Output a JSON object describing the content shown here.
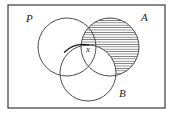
{
  "figure": {
    "kind": "venn-diagram",
    "title": "",
    "background_color": "#ffffff",
    "stroke_color": "#3a3a3a",
    "hatch_color": "#4a4a4a",
    "frame": {
      "name": "universal-set-rectangle",
      "x": 8,
      "y": 5,
      "width": 157,
      "height": 103,
      "stroke_width": 1.2
    },
    "circles": [
      {
        "id": "P",
        "label": "P",
        "cx": 67,
        "cy": 47,
        "r": 29,
        "filled": false
      },
      {
        "id": "A",
        "label": "A",
        "cx": 110,
        "cy": 47,
        "r": 29,
        "filled": true
      },
      {
        "id": "B",
        "label": "B",
        "cx": 88,
        "cy": 73,
        "r": 28,
        "filled": false
      }
    ],
    "shaded_region": {
      "name": "A-minus-B",
      "description": "A \\ B",
      "pattern": "horizontal-lines",
      "line_spacing": 2.4,
      "line_width": 0.7
    },
    "labels": [
      {
        "id": "label-P",
        "text": "P",
        "x": 26,
        "y": 22,
        "size": "major"
      },
      {
        "id": "label-A",
        "text": "A",
        "x": 141,
        "y": 21,
        "size": "major"
      },
      {
        "id": "label-B",
        "text": "B",
        "x": 119,
        "y": 97,
        "size": "major"
      },
      {
        "id": "label-x",
        "text": "x",
        "x": 86,
        "y": 52,
        "size": "minor"
      }
    ]
  }
}
